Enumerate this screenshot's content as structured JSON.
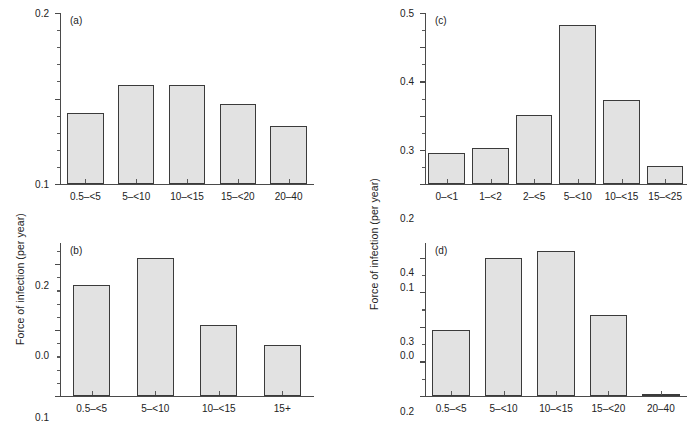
{
  "figure": {
    "axis_label_left": "Force of infection (per year)",
    "axis_label_right": "Force of infection (per year)",
    "bar_fill_color": "#e2e2e2",
    "bar_border_color": "#3b3b3b",
    "axis_color": "#4a4a4a",
    "background_color": "#ffffff"
  },
  "chart_data": [
    {
      "type": "bar",
      "panel": "(a)",
      "title": "",
      "xlabel": "",
      "ylabel": "Force of infection (per year)",
      "categories": [
        "0.5–<5",
        "5–<10",
        "10–<15",
        "15–<20",
        "20–40"
      ],
      "values": [
        0.083,
        0.116,
        0.116,
        0.093,
        0.068
      ],
      "ylim": [
        0.0,
        0.2
      ],
      "ytick_major": [
        0.0,
        0.1,
        0.2
      ],
      "ytick_major_labels": [
        "0.0",
        "0.1",
        "0.2"
      ],
      "ytick_minor_step": 0.02,
      "grid": false,
      "legend": "none"
    },
    {
      "type": "bar",
      "panel": "(b)",
      "title": "",
      "xlabel": "",
      "ylabel": "Force of infection (per year)",
      "categories": [
        "0.5–<5",
        "5–<10",
        "10–<15",
        "15+"
      ],
      "values": [
        0.168,
        0.209,
        0.108,
        0.078
      ],
      "ylim": [
        0.0,
        0.232
      ],
      "ytick_major": [
        0.0,
        0.1,
        0.2
      ],
      "ytick_major_labels": [
        "0.0",
        "0.1",
        "0.2"
      ],
      "ytick_minor_step": 0.02,
      "grid": false,
      "legend": "none"
    },
    {
      "type": "bar",
      "panel": "(c)",
      "title": "",
      "xlabel": "",
      "ylabel": "Force of infection (per year)",
      "categories": [
        "0–<1",
        "1–<2",
        "2–<5",
        "5–<10",
        "10–<15",
        "15–<25"
      ],
      "values": [
        0.092,
        0.105,
        0.201,
        0.464,
        0.247,
        0.052
      ],
      "ylim": [
        0.0,
        0.5
      ],
      "ytick_major": [
        0.0,
        0.1,
        0.2,
        0.3,
        0.4,
        0.5
      ],
      "ytick_major_labels": [
        "0.0",
        "0.1",
        "0.2",
        "0.3",
        "0.4",
        "0.5"
      ],
      "ytick_minor_step": 0.05,
      "grid": false,
      "legend": "none"
    },
    {
      "type": "bar",
      "panel": "(d)",
      "title": "",
      "xlabel": "",
      "ylabel": "Force of infection (per year)",
      "categories": [
        "0.5–<5",
        "5–<10",
        "10–<15",
        "15–<20",
        "20–40"
      ],
      "values": [
        0.191,
        0.399,
        0.418,
        0.235,
        0.007
      ],
      "ylim": [
        0.0,
        0.442
      ],
      "ytick_major": [
        0.0,
        0.1,
        0.2,
        0.3,
        0.4
      ],
      "ytick_major_labels": [
        "0.0",
        "0.1",
        "0.2",
        "0.3",
        "0.4"
      ],
      "ytick_minor_step": 0.05,
      "grid": false,
      "legend": "none"
    }
  ]
}
